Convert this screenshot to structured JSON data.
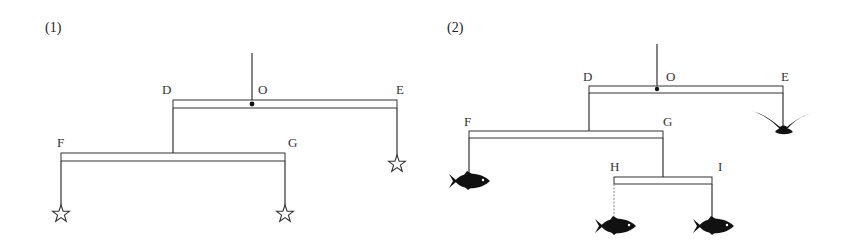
{
  "panels": [
    {
      "label": "(1)",
      "points": {
        "D": "D",
        "O": "O",
        "E": "E",
        "F": "F",
        "G": "G"
      },
      "hanging_objects": [
        {
          "point": "F",
          "object": "star"
        },
        {
          "point": "G",
          "object": "star"
        },
        {
          "point": "E",
          "object": "star"
        }
      ]
    },
    {
      "label": "(2)",
      "points": {
        "D": "D",
        "O": "O",
        "E": "E",
        "F": "F",
        "G": "G",
        "H": "H",
        "I": "I"
      },
      "hanging_objects": [
        {
          "point": "F",
          "object": "fish"
        },
        {
          "point": "H",
          "object": "fish"
        },
        {
          "point": "I",
          "object": "fish"
        },
        {
          "point": "E",
          "object": "bird"
        }
      ]
    }
  ],
  "colors": {
    "line": "#333333",
    "fill": "#111111",
    "rod_fill": "#ffffff"
  }
}
